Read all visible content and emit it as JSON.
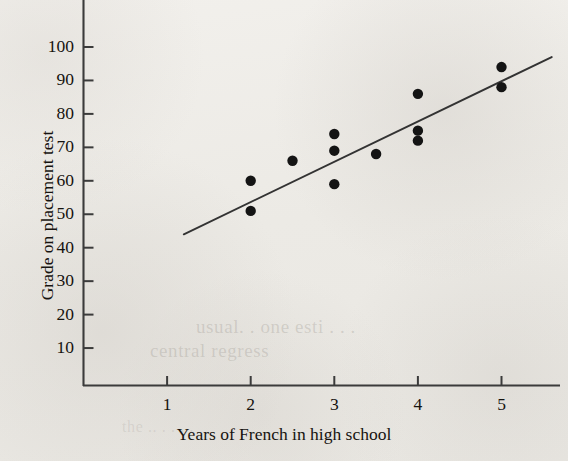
{
  "chart_data": {
    "type": "scatter",
    "title": "",
    "xlabel": "Years of French in high school",
    "ylabel": "Grade on placement test",
    "xlim": [
      0,
      5.6
    ],
    "ylim": [
      0,
      108
    ],
    "xticks": [
      1,
      2,
      3,
      4,
      5
    ],
    "xtick_labels": [
      "1",
      "2",
      "3",
      "4",
      "5"
    ],
    "yticks": [
      10,
      20,
      30,
      40,
      50,
      60,
      70,
      80,
      90,
      100
    ],
    "ytick_labels": [
      "10",
      "20",
      "30",
      "40",
      "50",
      "60",
      "70",
      "80",
      "90",
      "100"
    ],
    "grid": false,
    "legend": null,
    "points": [
      {
        "x": 2.0,
        "y": 60
      },
      {
        "x": 2.0,
        "y": 51
      },
      {
        "x": 2.5,
        "y": 66
      },
      {
        "x": 3.0,
        "y": 74
      },
      {
        "x": 3.0,
        "y": 69
      },
      {
        "x": 3.0,
        "y": 59
      },
      {
        "x": 3.5,
        "y": 68
      },
      {
        "x": 4.0,
        "y": 86
      },
      {
        "x": 4.0,
        "y": 75
      },
      {
        "x": 4.0,
        "y": 72
      },
      {
        "x": 5.0,
        "y": 94
      },
      {
        "x": 5.0,
        "y": 88
      }
    ],
    "fit_line": {
      "label": "least-squares regression line",
      "x_start": 1.2,
      "y_start": 44,
      "x_end": 5.6,
      "y_end": 97
    },
    "marker_style": "filled-circle",
    "marker_color": "#141414",
    "line_color": "#333333"
  },
  "background": {
    "ghost_text_1": "usual.  . one  esti  . . .",
    "ghost_text_2": "central regress",
    "ghost_text_3": "the   ..   . . . ."
  },
  "colors": {
    "paper": "#eceae6",
    "ink": "#16130f",
    "axis": "#3b3b3b",
    "marker": "#141414"
  }
}
